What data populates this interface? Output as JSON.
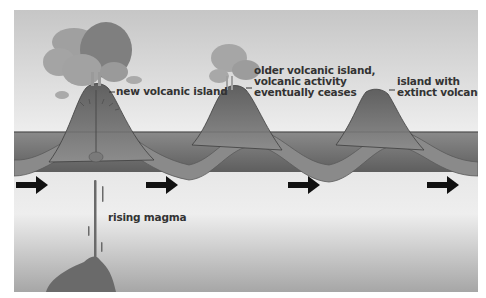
{
  "diagram": {
    "labels": {
      "new_island": "new volcanic island",
      "older_island_line1": "older volcanic island,",
      "older_island_line2": "volcanic activity",
      "older_island_line3": "eventually ceases",
      "extinct_line1": "island with",
      "extinct_line2": "extinct volcano",
      "magma": "rising magma"
    },
    "arrows": {
      "count": 4,
      "direction": "right",
      "meaning": "plate motion"
    },
    "colors": {
      "sky_top": "#c8c8c8",
      "sky_bottom": "#efefef",
      "ocean": "#6e6e6e",
      "crust": "#8a8a8a",
      "volcano": "#777777",
      "mantle_top": "#e8e8e8",
      "mantle_bottom": "#a8a8a8",
      "magma": "#6a6a6a",
      "arrow": "#111111",
      "text": "#333333"
    }
  }
}
